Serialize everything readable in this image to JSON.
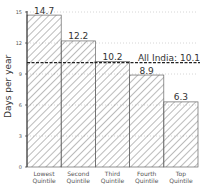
{
  "chart_data": {
    "type": "bar",
    "title": "",
    "xlabel": "",
    "ylabel": "Days per year",
    "ylim": [
      0,
      15
    ],
    "yticks": [
      0,
      3,
      6,
      9,
      12,
      15
    ],
    "grid": "dotted horizontal at 12, 15, 9",
    "categories": [
      "Lowest Quintile",
      "Second Quintile",
      "Third Quintile",
      "Fourth Quintile",
      "Top Quintile"
    ],
    "category_lines": [
      [
        "Lowest",
        "Quintile"
      ],
      [
        "Second",
        "Quintile"
      ],
      [
        "Third",
        "Quintile"
      ],
      [
        "Fourth",
        "Quintile"
      ],
      [
        "Top",
        "Quintile"
      ]
    ],
    "values": [
      14.7,
      12.2,
      10.2,
      8.9,
      6.3
    ],
    "value_labels": [
      "14.7",
      "12.2",
      "10.2",
      "8.9",
      "6.3"
    ],
    "fill": "diagonal hatch",
    "reference_line": {
      "label": "All India: 10.1",
      "value": 10.1,
      "style": "dashed"
    }
  }
}
